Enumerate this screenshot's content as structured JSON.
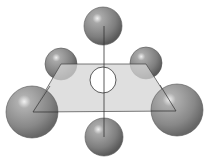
{
  "diagram": {
    "type": "molecular-geometry",
    "colors": {
      "background": "#ffffff",
      "plane_fill": "#d6d6d6",
      "sphere_base": "#8a8a8a",
      "sphere_dark": "#5e5e5e",
      "sphere_highlight": "#e8e8e8",
      "center_atom": "#ffffff",
      "lines": "#333333"
    },
    "central_atom": {
      "cx": 103,
      "cy": 80,
      "r": 13
    },
    "outer_atoms": [
      {
        "name": "axial-top",
        "cx": 103,
        "cy": 26,
        "r": 19
      },
      {
        "name": "equatorial-back-left",
        "cx": 61,
        "cy": 64,
        "r": 16
      },
      {
        "name": "equatorial-back-right",
        "cx": 146,
        "cy": 63,
        "r": 16
      },
      {
        "name": "equatorial-front-left",
        "cx": 32,
        "cy": 112,
        "r": 26
      },
      {
        "name": "equatorial-front-right",
        "cx": 177,
        "cy": 110,
        "r": 26
      },
      {
        "name": "axial-bottom",
        "cx": 104,
        "cy": 137,
        "r": 19
      }
    ],
    "plane": {
      "points": "61,64 146,64 176,111 33,112"
    }
  }
}
